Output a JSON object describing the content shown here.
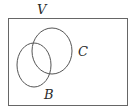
{
  "diagram": {
    "type": "venn",
    "universe": {
      "label": "V",
      "x": 8,
      "y": 18,
      "width": 119,
      "height": 87
    },
    "sets": [
      {
        "id": "C",
        "label": "C",
        "cx": 52,
        "cy": 51,
        "rx": 20,
        "ry": 23,
        "label_x": 79,
        "label_y": 56
      },
      {
        "id": "B",
        "label": "B",
        "cx": 34,
        "cy": 65,
        "rx": 17,
        "ry": 22,
        "label_x": 44,
        "label_y": 99
      }
    ],
    "stroke_color": "#555555"
  }
}
